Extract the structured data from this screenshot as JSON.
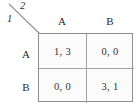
{
  "figure": {
    "type": "normal-form-game-payoff-matrix",
    "corner": {
      "row_player_label": "1",
      "column_player_label": "2"
    },
    "column_headers": [
      "A",
      "B"
    ],
    "row_headers": [
      "A",
      "B"
    ],
    "cells": [
      [
        "1, 3",
        "0, 0"
      ],
      [
        "0, 0",
        "3, 1"
      ]
    ],
    "colors": {
      "border": "#8e8e8e",
      "inner_rule": "#a3a3a3",
      "cell_background": "#fbfbfb",
      "text": "#2b2b2b",
      "page_background": "#ffffff"
    }
  }
}
